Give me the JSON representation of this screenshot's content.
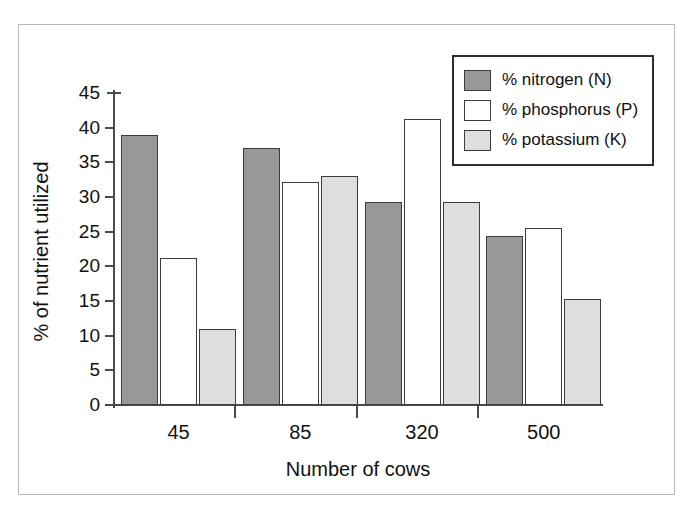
{
  "chart_data": {
    "type": "bar",
    "title": "",
    "xlabel": "Number of cows",
    "ylabel": "% of nutrient utilized",
    "categories": [
      "45",
      "85",
      "320",
      "500"
    ],
    "series": [
      {
        "name": "% nitrogen (N)",
        "key": "nitrogen",
        "color": "#989898",
        "values": [
          39.0,
          37.0,
          29.3,
          24.4
        ]
      },
      {
        "name": "% phosphorus (P)",
        "key": "phosphorus",
        "color": "#ffffff",
        "values": [
          21.2,
          32.2,
          41.2,
          25.6
        ]
      },
      {
        "name": "% potassium (K)",
        "key": "potassium",
        "color": "#dedede",
        "values": [
          11.0,
          33.0,
          29.3,
          15.3
        ]
      }
    ],
    "ylim": [
      0,
      45
    ],
    "ytick_step": 5,
    "yticks": [
      "0",
      "5",
      "10",
      "15",
      "20",
      "25",
      "30",
      "35",
      "40",
      "45"
    ],
    "grid": false,
    "legend_position": "top-right"
  },
  "legend": {
    "entries": [
      {
        "label": "% nitrogen (N)"
      },
      {
        "label": "% phosphorus (P)"
      },
      {
        "label": "% potassium (K)"
      }
    ]
  },
  "axes": {
    "x_title": "Number of cows",
    "y_title": "% of nutrient utilized",
    "x_labels": [
      "45",
      "85",
      "320",
      "500"
    ],
    "y_labels": [
      "45",
      "40",
      "35",
      "30",
      "25",
      "20",
      "15",
      "10",
      "5",
      "0"
    ]
  },
  "colors": {
    "nitrogen": "#989898",
    "phosphorus": "#ffffff",
    "potassium": "#dedede",
    "outline": "#3c3c3c",
    "axis": "#4a4a4a",
    "frame": "#b9b9b9",
    "background": "#ffffff"
  }
}
